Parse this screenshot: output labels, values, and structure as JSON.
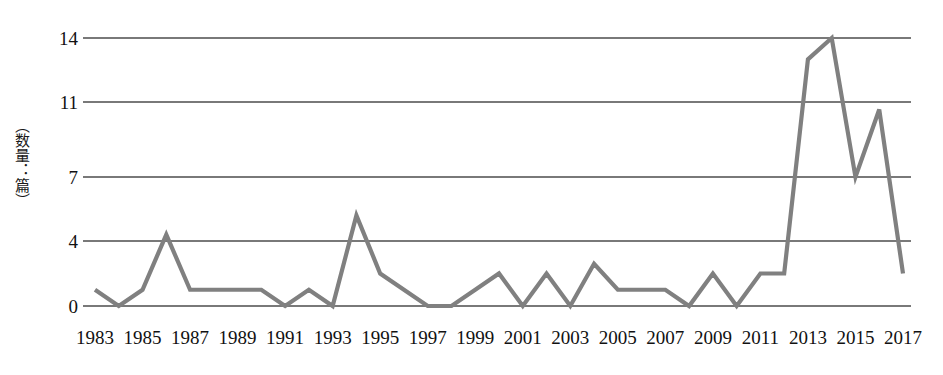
{
  "chart_data": {
    "type": "line",
    "title": "",
    "subtitle": "",
    "xlabel": "",
    "ylabel": "（数量：篇）",
    "legend": [],
    "legend_position": "none",
    "grid": true,
    "grid_axis": "y",
    "line_color": "#808080",
    "axis_color": "#4d4d4d",
    "background": "#ffffff",
    "xlim": [
      1983,
      2017
    ],
    "ylim": [
      0,
      14
    ],
    "y_ticks": [
      0,
      4,
      7,
      11,
      14
    ],
    "y_tick_labels": [
      "0",
      "4",
      "7",
      "11",
      "14"
    ],
    "x_ticks": [
      1983,
      1985,
      1987,
      1989,
      1991,
      1993,
      1995,
      1997,
      1999,
      2001,
      2003,
      2005,
      2007,
      2009,
      2011,
      2013,
      2015,
      2017
    ],
    "x_tick_labels": [
      "1983",
      "1985",
      "1987",
      "1989",
      "1991",
      "1993",
      "1995",
      "1997",
      "1999",
      "2001",
      "2003",
      "2005",
      "2007",
      "2009",
      "2011",
      "2013",
      "2015",
      "2017"
    ],
    "x": [
      1983,
      1984,
      1985,
      1986,
      1987,
      1988,
      1989,
      1990,
      1991,
      1992,
      1993,
      1994,
      1995,
      1996,
      1997,
      1998,
      1999,
      2000,
      2001,
      2002,
      2003,
      2004,
      2005,
      2006,
      2007,
      2008,
      2009,
      2010,
      2011,
      2012,
      2013,
      2014,
      2015,
      2016,
      2017
    ],
    "values": [
      1,
      0,
      1,
      4.3,
      1,
      1,
      1,
      1,
      0,
      1,
      0,
      5.2,
      2,
      1,
      0,
      0,
      1,
      2,
      0,
      2,
      0,
      2.6,
      1,
      1,
      1,
      0,
      2,
      0,
      2,
      2,
      13,
      14,
      7,
      10.6,
      2
    ],
    "series": [
      {
        "name": "",
        "values": [
          1,
          0,
          1,
          4.3,
          1,
          1,
          1,
          1,
          0,
          1,
          0,
          5.2,
          2,
          1,
          0,
          0,
          1,
          2,
          0,
          2,
          0,
          2.6,
          1,
          1,
          1,
          0,
          2,
          0,
          2,
          2,
          13,
          14,
          7,
          10.6,
          2
        ]
      }
    ]
  }
}
